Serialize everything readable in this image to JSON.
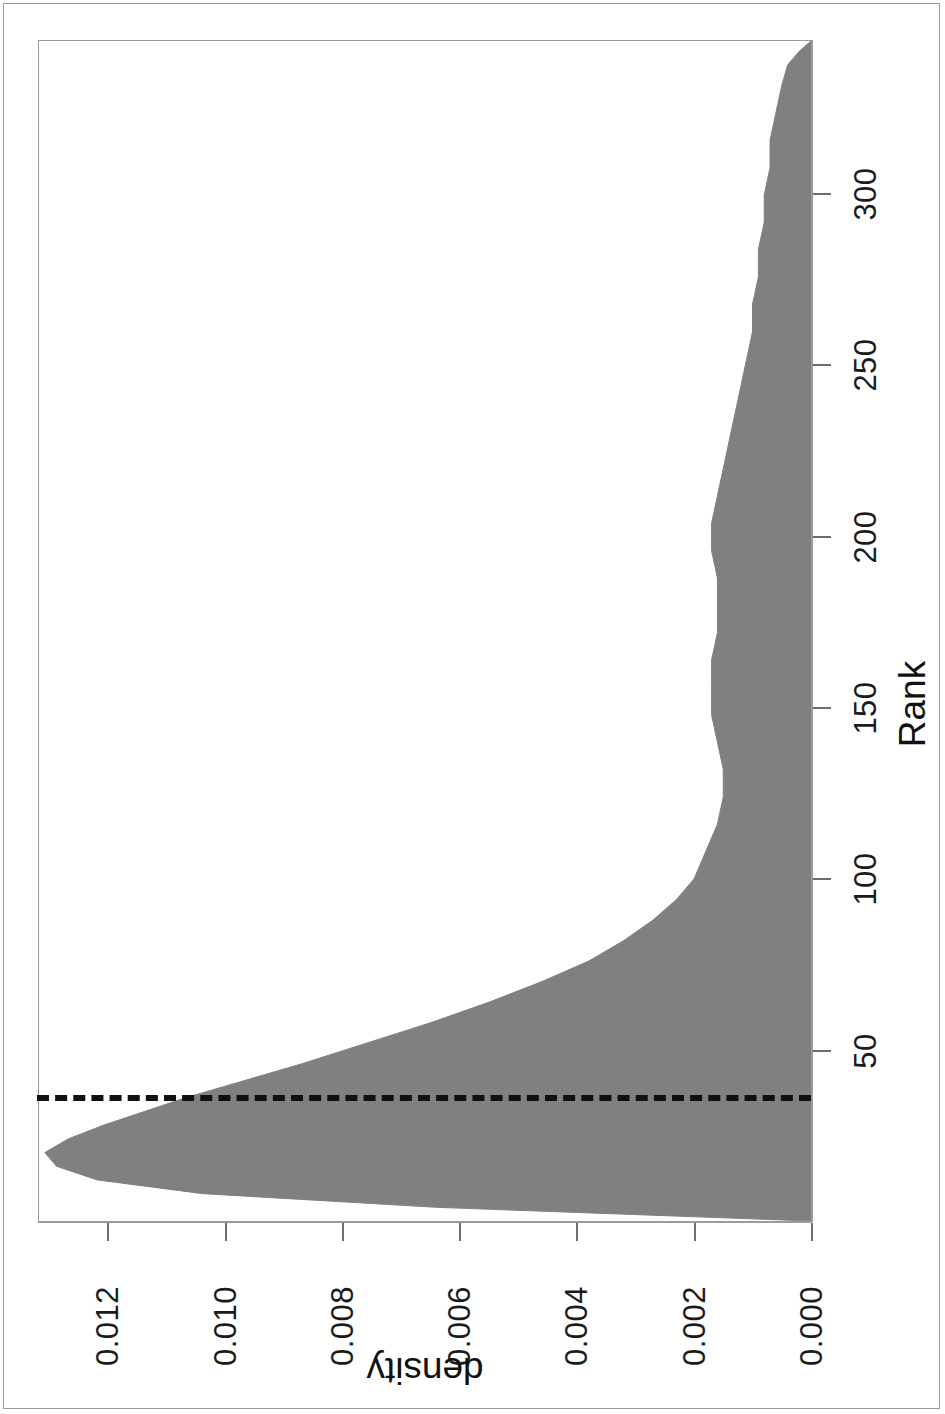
{
  "figure": {
    "orientation_degrees": 180,
    "page_border_color": "#9a9a9a",
    "background": "#ffffff"
  },
  "chart_data": {
    "type": "area",
    "title": "",
    "subtitle": "",
    "xlabel": "Rank",
    "ylabel": "density",
    "grid": false,
    "legend": null,
    "fill_color": "#808080",
    "line_color": "#808080",
    "xlim": [
      0,
      345
    ],
    "ylim": [
      0.0,
      0.0132
    ],
    "xticks": [
      50,
      100,
      150,
      200,
      250,
      300
    ],
    "xtick_labels": [
      "50",
      "100",
      "150",
      "200",
      "250",
      "300"
    ],
    "yticks": [
      0.0,
      0.002,
      0.004,
      0.006,
      0.008,
      0.01,
      0.012
    ],
    "ytick_labels": [
      "0.000",
      "0.002",
      "0.004",
      "0.006",
      "0.008",
      "0.010",
      "0.012"
    ],
    "annotations": [
      {
        "kind": "vline",
        "label": "",
        "x": 36,
        "linestyle": "dashed",
        "color": "#101010",
        "linewidth": 6
      }
    ],
    "x": [
      0,
      4,
      8,
      12,
      16,
      20,
      24,
      28,
      32,
      36,
      40,
      46,
      52,
      58,
      64,
      70,
      76,
      82,
      88,
      94,
      100,
      108,
      116,
      124,
      132,
      140,
      148,
      156,
      164,
      172,
      180,
      188,
      196,
      204,
      212,
      220,
      228,
      236,
      244,
      252,
      260,
      268,
      276,
      284,
      292,
      300,
      308,
      316,
      324,
      332,
      338,
      342,
      345
    ],
    "y": [
      0.0,
      0.0064,
      0.0104,
      0.0122,
      0.0129,
      0.0131,
      0.0127,
      0.0121,
      0.0114,
      0.0107,
      0.0099,
      0.0087,
      0.0076,
      0.0065,
      0.0055,
      0.0046,
      0.0038,
      0.0032,
      0.0027,
      0.0023,
      0.002,
      0.0018,
      0.0016,
      0.0015,
      0.0015,
      0.0016,
      0.0017,
      0.0017,
      0.0017,
      0.0016,
      0.0016,
      0.0016,
      0.0017,
      0.0017,
      0.0016,
      0.0015,
      0.0014,
      0.0013,
      0.0012,
      0.0011,
      0.001,
      0.001,
      0.0009,
      0.0009,
      0.0008,
      0.0008,
      0.0007,
      0.0007,
      0.0006,
      0.0005,
      0.0004,
      0.0002,
      0.0
    ]
  },
  "axes": {
    "x_title": "Rank",
    "y_title": "density"
  }
}
